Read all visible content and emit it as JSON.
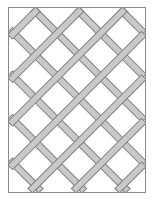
{
  "diagram": {
    "type": "lattice-trellis",
    "frame": {
      "x": 8.5,
      "y": 7.5,
      "width": 137,
      "height": 185,
      "stroke": "#8a8a8a",
      "fill": "#ffffff"
    },
    "bars": {
      "fill": "#c9c9c9",
      "stroke": "#7f7f7f",
      "width": 6,
      "spacing": 43.5,
      "angle_deg": 45
    },
    "colors": {
      "background": "#ffffff",
      "bar": "#c9c9c9",
      "outline": "#7f7f7f",
      "frame": "#8a8a8a"
    }
  }
}
